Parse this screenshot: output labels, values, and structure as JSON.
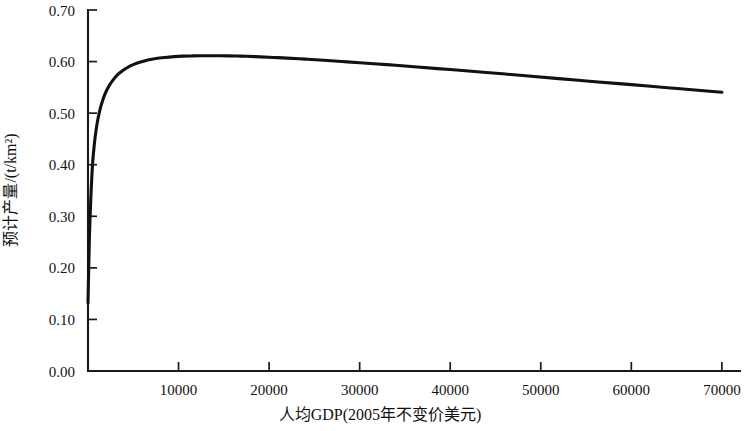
{
  "chart_data": {
    "type": "line",
    "title": "",
    "subtitle": "",
    "xlabel": "人均GDP(2005年不变价美元)",
    "ylabel": "预计产量/(t/km²)",
    "xlim": [
      0,
      72000
    ],
    "ylim": [
      0.0,
      0.7
    ],
    "xticks": [
      0,
      10000,
      20000,
      30000,
      40000,
      50000,
      60000,
      70000
    ],
    "xticklabels": [
      "",
      "10000",
      "20000",
      "30000",
      "40000",
      "50000",
      "60000",
      "70000"
    ],
    "yticks": [
      0.0,
      0.1,
      0.2,
      0.3,
      0.4,
      0.5,
      0.6,
      0.7
    ],
    "yticklabels": [
      "0.00",
      "0.10",
      "0.20",
      "0.30",
      "0.40",
      "0.50",
      "0.60",
      "0.70"
    ],
    "grid": false,
    "legend": null,
    "legend_position": "none",
    "series": [
      {
        "name": "预计产量",
        "color": "#111111",
        "x": [
          0,
          150,
          300,
          500,
          700,
          900,
          1100,
          1400,
          1700,
          2000,
          2400,
          2800,
          3300,
          3800,
          4400,
          5000,
          5800,
          6600,
          7500,
          8500,
          9500,
          10500,
          11500,
          12500,
          13500,
          14500,
          15500,
          16500,
          17500,
          19000,
          20500,
          22000,
          24000,
          26000,
          28000,
          30000,
          33000,
          36000,
          40000,
          44000,
          48000,
          52000,
          56000,
          60000,
          64000,
          68000,
          70000
        ],
        "y": [
          0.132,
          0.255,
          0.33,
          0.4,
          0.44,
          0.468,
          0.489,
          0.512,
          0.529,
          0.542,
          0.555,
          0.565,
          0.575,
          0.582,
          0.589,
          0.594,
          0.599,
          0.603,
          0.606,
          0.608,
          0.6095,
          0.6105,
          0.611,
          0.6113,
          0.6114,
          0.6113,
          0.6111,
          0.6107,
          0.6102,
          0.6092,
          0.608,
          0.6067,
          0.6047,
          0.6025,
          0.6002,
          0.5978,
          0.594,
          0.59,
          0.5845,
          0.5788,
          0.573,
          0.567,
          0.561,
          0.5553,
          0.5493,
          0.5435,
          0.5405
        ]
      }
    ]
  },
  "axis": {
    "y_axis_name": "y-axis",
    "x_axis_name": "x-axis"
  }
}
